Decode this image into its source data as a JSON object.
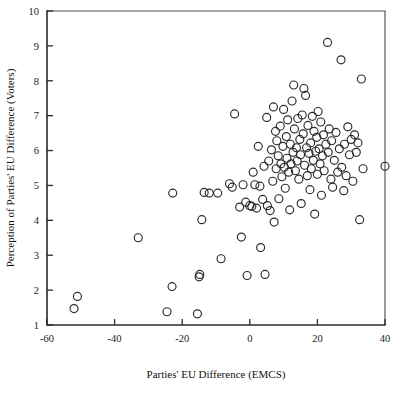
{
  "chart_data": {
    "type": "scatter",
    "title": "",
    "xlabel": "Parties' EU Difference (EMCS)",
    "ylabel": "Perception of Parties' EU Difference (Voters)",
    "xlim": [
      -60,
      40
    ],
    "ylim": [
      1,
      10
    ],
    "xticks": [
      -60,
      -40,
      -20,
      0,
      20,
      40
    ],
    "xtick_labels": [
      "-60",
      "-40",
      "-20",
      "0",
      "20",
      "40"
    ],
    "yticks": [
      1,
      2,
      3,
      4,
      5,
      6,
      7,
      8,
      9,
      10
    ],
    "ytick_labels": [
      "1",
      "2",
      "3",
      "4",
      "5",
      "6",
      "7",
      "8",
      "9",
      "10"
    ],
    "grid": false,
    "legend": null,
    "marker": {
      "shape": "open-circle",
      "radius_px": 4.0,
      "stroke_color": "#2a2a2a",
      "fill": "none",
      "stroke_width_px": 1.15
    },
    "frame_color": "#4a4a4a",
    "axis_color": "#2b2b2b",
    "background_color": "#ffffff",
    "n_points": 126,
    "points": [
      [
        -52.0,
        1.47
      ],
      [
        -51.0,
        1.82
      ],
      [
        -33.0,
        3.5
      ],
      [
        -24.5,
        1.38
      ],
      [
        -23.0,
        2.1
      ],
      [
        -22.8,
        4.78
      ],
      [
        -15.5,
        1.32
      ],
      [
        -15.0,
        2.38
      ],
      [
        -14.8,
        2.45
      ],
      [
        -14.2,
        4.02
      ],
      [
        -13.5,
        4.8
      ],
      [
        -12.0,
        4.78
      ],
      [
        -9.5,
        4.78
      ],
      [
        -8.5,
        2.9
      ],
      [
        -6.0,
        5.05
      ],
      [
        -5.2,
        4.95
      ],
      [
        -4.5,
        7.05
      ],
      [
        -3.0,
        4.38
      ],
      [
        -2.5,
        3.52
      ],
      [
        -2.0,
        5.02
      ],
      [
        -1.2,
        4.52
      ],
      [
        -0.8,
        2.42
      ],
      [
        0.0,
        4.42
      ],
      [
        0.6,
        4.4
      ],
      [
        1.0,
        5.38
      ],
      [
        1.5,
        5.02
      ],
      [
        2.0,
        4.35
      ],
      [
        2.5,
        6.12
      ],
      [
        3.0,
        4.98
      ],
      [
        3.2,
        3.22
      ],
      [
        3.8,
        4.6
      ],
      [
        4.2,
        5.55
      ],
      [
        4.5,
        2.45
      ],
      [
        5.0,
        6.95
      ],
      [
        5.2,
        4.42
      ],
      [
        5.6,
        5.7
      ],
      [
        6.0,
        4.28
      ],
      [
        6.4,
        6.02
      ],
      [
        6.8,
        5.12
      ],
      [
        7.0,
        7.25
      ],
      [
        7.2,
        3.95
      ],
      [
        7.6,
        6.55
      ],
      [
        7.8,
        5.48
      ],
      [
        8.0,
        6.28
      ],
      [
        8.4,
        5.85
      ],
      [
        8.6,
        4.62
      ],
      [
        9.0,
        6.7
      ],
      [
        9.2,
        5.62
      ],
      [
        9.5,
        5.25
      ],
      [
        9.8,
        6.12
      ],
      [
        10.0,
        7.18
      ],
      [
        10.2,
        5.52
      ],
      [
        10.5,
        4.92
      ],
      [
        10.8,
        6.4
      ],
      [
        11.0,
        5.78
      ],
      [
        11.2,
        6.88
      ],
      [
        11.5,
        5.38
      ],
      [
        11.8,
        4.3
      ],
      [
        12.0,
        6.18
      ],
      [
        12.2,
        5.62
      ],
      [
        12.5,
        7.42
      ],
      [
        12.8,
        5.95
      ],
      [
        13.0,
        7.88
      ],
      [
        13.2,
        6.62
      ],
      [
        13.5,
        5.42
      ],
      [
        13.8,
        6.08
      ],
      [
        14.0,
        5.7
      ],
      [
        14.2,
        6.92
      ],
      [
        14.5,
        5.18
      ],
      [
        14.8,
        6.32
      ],
      [
        15.0,
        5.88
      ],
      [
        15.2,
        4.48
      ],
      [
        15.5,
        7.02
      ],
      [
        15.8,
        6.48
      ],
      [
        16.0,
        7.78
      ],
      [
        16.2,
        5.58
      ],
      [
        16.5,
        7.58
      ],
      [
        16.8,
        6.08
      ],
      [
        17.0,
        5.28
      ],
      [
        17.2,
        6.72
      ],
      [
        17.5,
        5.92
      ],
      [
        17.8,
        4.88
      ],
      [
        18.0,
        6.22
      ],
      [
        18.2,
        5.48
      ],
      [
        18.5,
        6.98
      ],
      [
        18.8,
        5.72
      ],
      [
        19.0,
        6.55
      ],
      [
        19.2,
        4.18
      ],
      [
        19.5,
        5.98
      ],
      [
        19.8,
        6.38
      ],
      [
        20.0,
        5.32
      ],
      [
        20.2,
        7.12
      ],
      [
        20.5,
        6.05
      ],
      [
        20.8,
        5.62
      ],
      [
        21.0,
        6.82
      ],
      [
        21.2,
        4.72
      ],
      [
        21.5,
        5.85
      ],
      [
        21.8,
        6.45
      ],
      [
        22.0,
        5.42
      ],
      [
        22.5,
        6.18
      ],
      [
        23.0,
        9.1
      ],
      [
        23.2,
        5.95
      ],
      [
        23.5,
        6.62
      ],
      [
        24.0,
        5.18
      ],
      [
        24.2,
        6.28
      ],
      [
        24.5,
        4.95
      ],
      [
        25.0,
        5.72
      ],
      [
        25.5,
        6.52
      ],
      [
        26.0,
        5.38
      ],
      [
        26.5,
        6.05
      ],
      [
        27.0,
        8.6
      ],
      [
        27.2,
        5.52
      ],
      [
        27.8,
        4.85
      ],
      [
        28.0,
        6.18
      ],
      [
        28.5,
        5.28
      ],
      [
        29.0,
        6.68
      ],
      [
        29.5,
        5.88
      ],
      [
        30.0,
        6.32
      ],
      [
        30.5,
        5.12
      ],
      [
        31.0,
        6.45
      ],
      [
        31.5,
        5.95
      ],
      [
        32.0,
        6.22
      ],
      [
        32.5,
        4.02
      ],
      [
        33.0,
        8.05
      ],
      [
        33.5,
        5.48
      ],
      [
        40.0,
        5.55
      ]
    ]
  }
}
